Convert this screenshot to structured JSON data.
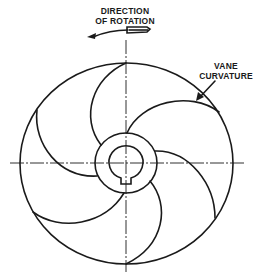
{
  "diagram": {
    "type": "impeller-vane-diagram",
    "labels": {
      "rotation_line1": "DIRECTION",
      "rotation_line2": "OF ROTATION",
      "vane_line1": "VANE",
      "vane_line2": "CURVATURE"
    },
    "components": {
      "outer_rim": "outer-circle",
      "hub": "hub-ring",
      "bore": "shaft-bore-with-keyway",
      "vane_count": 6,
      "rotation_direction": "counterclockwise"
    },
    "colors": {
      "ink": "#1a1a1a",
      "background": "#ffffff"
    }
  }
}
